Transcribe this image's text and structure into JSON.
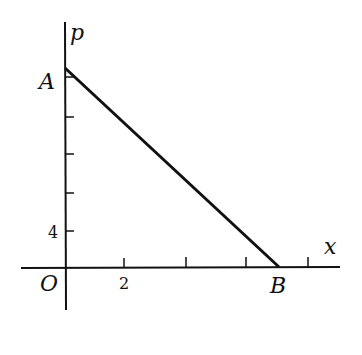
{
  "diagram": {
    "axes": {
      "x_label": "x",
      "y_label": "p",
      "origin_label": "O"
    },
    "points": [
      {
        "name": "A",
        "location": "on p-axis (top of line)"
      },
      {
        "name": "B",
        "location": "on x-axis (end of line)"
      }
    ],
    "tick_labels": {
      "x": "2",
      "y": "4"
    },
    "line": {
      "from": "A",
      "to": "B"
    },
    "colors": {
      "stroke": "#111111",
      "background": "#ffffff"
    }
  }
}
